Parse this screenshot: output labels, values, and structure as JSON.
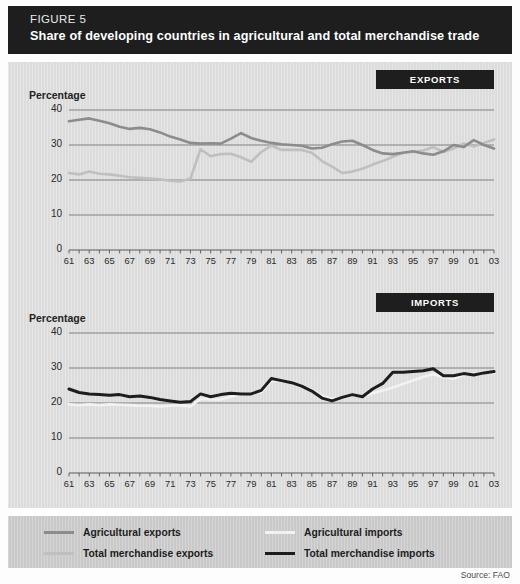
{
  "figure": {
    "label": "FIGURE 5",
    "title": "Share of developing countries in agricultural and total merchandise trade",
    "source": "Source: FAO"
  },
  "panels": [
    {
      "id": "exports",
      "badge": "EXPORTS",
      "axis_title": "Percentage"
    },
    {
      "id": "imports",
      "badge": "IMPORTS",
      "axis_title": "Percentage"
    }
  ],
  "legend": [
    {
      "label": "Agricultural exports",
      "color": "#8c8c8c"
    },
    {
      "label": "Agricultural imports",
      "color": "#f2f2f2"
    },
    {
      "label": "Total merchandise exports",
      "color": "#bfbfbf"
    },
    {
      "label": "Total merchandise imports",
      "color": "#1d1d1d"
    }
  ],
  "colors": {
    "title_bar": "#1e1e1e",
    "panel_bg": "#dcdcdc",
    "legend_bg": "#c9c9c9",
    "gridline": "#6f6f6f",
    "agricultural_exports": "#8c8c8c",
    "total_merchandise_exports": "#bfbfbf",
    "agricultural_imports": "#f2f2f2",
    "total_merchandise_imports": "#1d1d1d"
  },
  "chart_data": [
    {
      "type": "line",
      "id": "exports",
      "title": "EXPORTS",
      "xlabel": "",
      "ylabel": "Percentage",
      "ylim": [
        0,
        40
      ],
      "yticks": [
        0,
        10,
        20,
        30,
        40
      ],
      "grid": true,
      "legend_position": "below-figure",
      "xticks": [
        "61",
        "63",
        "65",
        "67",
        "69",
        "71",
        "73",
        "75",
        "77",
        "79",
        "81",
        "83",
        "85",
        "87",
        "89",
        "91",
        "93",
        "95",
        "97",
        "99",
        "01",
        "03"
      ],
      "x": [
        1961,
        1962,
        1963,
        1964,
        1965,
        1966,
        1967,
        1968,
        1969,
        1970,
        1971,
        1972,
        1973,
        1974,
        1975,
        1976,
        1977,
        1978,
        1979,
        1980,
        1981,
        1982,
        1983,
        1984,
        1985,
        1986,
        1987,
        1988,
        1989,
        1990,
        1991,
        1992,
        1993,
        1994,
        1995,
        1996,
        1997,
        1998,
        1999,
        2000,
        2001,
        2002,
        2003
      ],
      "series": [
        {
          "name": "Agricultural exports",
          "color": "#8c8c8c",
          "values": [
            36.8,
            37.2,
            37.6,
            36.9,
            36.2,
            35.2,
            34.6,
            34.9,
            34.5,
            33.6,
            32.4,
            31.6,
            30.6,
            30.4,
            30.5,
            30.4,
            31.8,
            33.4,
            32.0,
            31.2,
            30.6,
            30.2,
            30.0,
            29.8,
            29.0,
            29.2,
            30.2,
            31.0,
            31.2,
            30.0,
            28.6,
            27.6,
            27.4,
            27.8,
            28.2,
            27.6,
            27.2,
            28.2,
            30.0,
            29.4,
            31.4,
            30.0,
            29.0
          ]
        },
        {
          "name": "Total merchandise exports",
          "color": "#bfbfbf",
          "values": [
            22.0,
            21.6,
            22.4,
            21.8,
            21.6,
            21.2,
            20.8,
            20.6,
            20.4,
            20.2,
            19.8,
            19.6,
            20.4,
            28.8,
            26.8,
            27.4,
            27.5,
            26.5,
            25.2,
            28.0,
            29.8,
            28.6,
            28.6,
            28.6,
            27.8,
            25.4,
            23.8,
            22.0,
            22.4,
            23.2,
            24.4,
            25.4,
            26.6,
            27.8,
            28.0,
            28.4,
            29.4,
            28.0,
            29.0,
            30.4,
            29.6,
            30.6,
            31.6
          ]
        }
      ]
    },
    {
      "type": "line",
      "id": "imports",
      "title": "IMPORTS",
      "xlabel": "",
      "ylabel": "Percentage",
      "ylim": [
        0,
        40
      ],
      "yticks": [
        0,
        10,
        20,
        30,
        40
      ],
      "grid": true,
      "legend_position": "below-figure",
      "xticks": [
        "61",
        "63",
        "65",
        "67",
        "69",
        "71",
        "73",
        "75",
        "77",
        "79",
        "81",
        "83",
        "85",
        "87",
        "89",
        "91",
        "93",
        "95",
        "97",
        "99",
        "01",
        "03"
      ],
      "x": [
        1961,
        1962,
        1963,
        1964,
        1965,
        1966,
        1967,
        1968,
        1969,
        1970,
        1971,
        1972,
        1973,
        1974,
        1975,
        1976,
        1977,
        1978,
        1979,
        1980,
        1981,
        1982,
        1983,
        1984,
        1985,
        1986,
        1987,
        1988,
        1989,
        1990,
        1991,
        1992,
        1993,
        1994,
        1995,
        1996,
        1997,
        1998,
        1999,
        2000,
        2001,
        2002,
        2003
      ],
      "series": [
        {
          "name": "Agricultural imports",
          "color": "#f2f2f2",
          "values": [
            19.6,
            19.4,
            19.6,
            19.4,
            19.6,
            19.5,
            19.4,
            19.2,
            19.2,
            19.0,
            19.2,
            19.4,
            19.0,
            21.2,
            21.0,
            21.0,
            21.8,
            22.4,
            22.8,
            23.0,
            26.4,
            26.2,
            25.8,
            25.0,
            23.8,
            22.0,
            21.2,
            21.4,
            22.2,
            21.8,
            22.8,
            23.6,
            24.4,
            25.4,
            26.4,
            27.4,
            28.2,
            27.4,
            27.0,
            28.0,
            28.4,
            28.6,
            28.6
          ]
        },
        {
          "name": "Total merchandise imports",
          "color": "#1d1d1d",
          "values": [
            24.0,
            23.0,
            22.6,
            22.4,
            22.2,
            22.4,
            21.8,
            22.0,
            21.6,
            21.0,
            20.6,
            20.2,
            20.4,
            22.6,
            21.8,
            22.4,
            22.8,
            22.6,
            22.6,
            23.6,
            27.0,
            26.4,
            25.8,
            24.8,
            23.4,
            21.4,
            20.6,
            21.6,
            22.4,
            21.8,
            24.0,
            25.6,
            28.8,
            28.8,
            29.0,
            29.2,
            29.8,
            27.8,
            27.8,
            28.4,
            28.0,
            28.6,
            29.0
          ]
        }
      ]
    }
  ]
}
